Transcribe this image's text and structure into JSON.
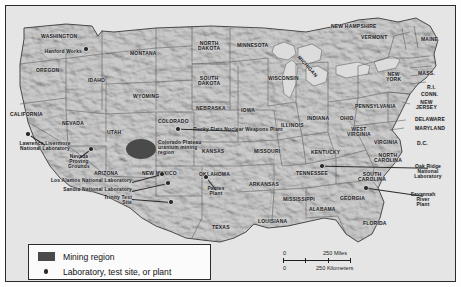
{
  "map": {
    "title": "United States nuclear weapons complex map",
    "background_color": "#c7c7c7",
    "border_color": "#2b2b2b",
    "mining_region_color": "#4a4a4a",
    "marker_color": "#2a2a2a"
  },
  "states": [
    {
      "name": "WASHINGTON",
      "x": 35,
      "y": 28,
      "size": "sm"
    },
    {
      "name": "OREGON",
      "x": 30,
      "y": 62,
      "size": "sm"
    },
    {
      "name": "IDAHO",
      "x": 82,
      "y": 72,
      "size": "sm"
    },
    {
      "name": "MONTANA",
      "x": 124,
      "y": 45,
      "size": "sm"
    },
    {
      "name": "WYOMING",
      "x": 127,
      "y": 88,
      "size": "sm"
    },
    {
      "name": "CALIFORNIA",
      "x": 4,
      "y": 106,
      "size": "sm"
    },
    {
      "name": "NEVADA",
      "x": 56,
      "y": 115,
      "size": "sm"
    },
    {
      "name": "UTAH",
      "x": 101,
      "y": 124,
      "size": "sm"
    },
    {
      "name": "ARIZONA",
      "x": 88,
      "y": 165,
      "size": "sm"
    },
    {
      "name": "COLORADO",
      "x": 152,
      "y": 113,
      "size": "sm"
    },
    {
      "name": "NEW MEXICO",
      "x": 136,
      "y": 165,
      "size": "sm"
    },
    {
      "name": "NORTH\nDAKOTA",
      "x": 192,
      "y": 35,
      "size": "sm"
    },
    {
      "name": "SOUTH\nDAKOTA",
      "x": 192,
      "y": 70,
      "size": "sm"
    },
    {
      "name": "NEBRASKA",
      "x": 190,
      "y": 100,
      "size": "sm"
    },
    {
      "name": "KANSAS",
      "x": 196,
      "y": 143,
      "size": "sm"
    },
    {
      "name": "OKLAHOMA",
      "x": 193,
      "y": 166,
      "size": "sm"
    },
    {
      "name": "TEXAS",
      "x": 206,
      "y": 219,
      "size": "sm"
    },
    {
      "name": "MINNESOTA",
      "x": 231,
      "y": 37,
      "size": "sm"
    },
    {
      "name": "IOWA",
      "x": 235,
      "y": 102,
      "size": "sm"
    },
    {
      "name": "MISSOURI",
      "x": 248,
      "y": 143,
      "size": "sm"
    },
    {
      "name": "ARKANSAS",
      "x": 243,
      "y": 176,
      "size": "sm"
    },
    {
      "name": "LOUISIANA",
      "x": 252,
      "y": 213,
      "size": "sm"
    },
    {
      "name": "WISCONSIN",
      "x": 262,
      "y": 70,
      "size": "sm"
    },
    {
      "name": "ILLINOIS",
      "x": 275,
      "y": 117,
      "size": "sm"
    },
    {
      "name": "MISSISSIPPI",
      "x": 277,
      "y": 191,
      "size": "sm"
    },
    {
      "name": "INDIANA",
      "x": 301,
      "y": 110,
      "size": "sm"
    },
    {
      "name": "KENTUCKY",
      "x": 305,
      "y": 144,
      "size": "sm"
    },
    {
      "name": "TENNESSEE",
      "x": 290,
      "y": 165,
      "size": "sm"
    },
    {
      "name": "ALABAMA",
      "x": 303,
      "y": 201,
      "size": "sm"
    },
    {
      "name": "OHIO",
      "x": 334,
      "y": 110,
      "size": "sm"
    },
    {
      "name": "WEST\nVIRGINIA",
      "x": 341,
      "y": 121,
      "size": "sm"
    },
    {
      "name": "VIRGINIA",
      "x": 368,
      "y": 134,
      "size": "sm"
    },
    {
      "name": "NORTH\nCAROLINA",
      "x": 368,
      "y": 147,
      "size": "sm"
    },
    {
      "name": "SOUTH\nCAROLINA",
      "x": 352,
      "y": 166,
      "size": "sm"
    },
    {
      "name": "GEORGIA",
      "x": 334,
      "y": 190,
      "size": "sm"
    },
    {
      "name": "FLORIDA",
      "x": 357,
      "y": 215,
      "size": "sm"
    },
    {
      "name": "PENNSYLVANIA",
      "x": 349,
      "y": 98,
      "size": "sm"
    },
    {
      "name": "NEW\nYORK",
      "x": 380,
      "y": 66,
      "size": "sm"
    },
    {
      "name": "NEW HAMPSHIRE",
      "x": 325,
      "y": 18,
      "size": "sm"
    },
    {
      "name": "VERMONT",
      "x": 355,
      "y": 29,
      "size": "sm"
    },
    {
      "name": "MAINE",
      "x": 415,
      "y": 31,
      "size": "sm"
    },
    {
      "name": "MASS.",
      "x": 412,
      "y": 65,
      "size": "sm"
    },
    {
      "name": "R.I.",
      "x": 421,
      "y": 79,
      "size": "sm"
    },
    {
      "name": "CONN.",
      "x": 415,
      "y": 86,
      "size": "sm"
    },
    {
      "name": "NEW\nJERSEY",
      "x": 410,
      "y": 94,
      "size": "sm"
    },
    {
      "name": "DELAWARE",
      "x": 409,
      "y": 111,
      "size": "sm"
    },
    {
      "name": "MARYLAND",
      "x": 409,
      "y": 120,
      "size": "sm"
    },
    {
      "name": "D.C.",
      "x": 411,
      "y": 135,
      "size": "sm"
    },
    {
      "name": "MICHIGAN",
      "x": 288,
      "y": 58,
      "size": "sm"
    }
  ],
  "facilities": [
    {
      "label": "Hanford Works",
      "lx": 28,
      "ly": 43,
      "align": "rt",
      "lw": 48,
      "dx": 80,
      "dy": 43
    },
    {
      "label": "Lawrence Livermore\nNational Laboratory",
      "lx": 8,
      "ly": 135,
      "align": "ctr",
      "lw": 62,
      "dx": 22,
      "dy": 128
    },
    {
      "label": "Nevada\nProving\nGrounds",
      "lx": 56,
      "ly": 148,
      "align": "ctr",
      "lw": 34,
      "dx": 85,
      "dy": 143
    },
    {
      "label": "Los Alamos National Laboratory",
      "lx": 8,
      "ly": 172,
      "align": "rt",
      "lw": 118,
      "dx": 156,
      "dy": 168
    },
    {
      "label": "Sandia National Laboratory",
      "lx": 20,
      "ly": 181,
      "align": "rt",
      "lw": 106,
      "dx": 162,
      "dy": 177
    },
    {
      "label": "Trinity Test\nSite",
      "lx": 76,
      "ly": 189,
      "align": "rt",
      "lw": 50,
      "dx": 165,
      "dy": 196
    },
    {
      "label": "Pantex\nPlant",
      "lx": 196,
      "ly": 180,
      "align": "ctr",
      "lw": 28,
      "dx": 200,
      "dy": 171
    },
    {
      "label": "Rocky Flats Nuclear Weapons Plant",
      "lx": 177,
      "ly": 121,
      "align": "ctr",
      "lw": 110,
      "dx": 172,
      "dy": 123
    },
    {
      "label": "Oak Ridge\nNational\nLaboratory",
      "lx": 398,
      "ly": 158,
      "align": "ctr",
      "lw": 48,
      "dx": 316,
      "dy": 160
    },
    {
      "label": "Savannah\nRiver\nPlant",
      "lx": 398,
      "ly": 186,
      "align": "ctr",
      "lw": 38,
      "dx": 360,
      "dy": 182
    }
  ],
  "mining_region": {
    "label": "Colorado Plateau\nuranium mining\nregion",
    "x": 152,
    "y": 134
  },
  "legend": {
    "items": [
      {
        "icon": "mining-swatch",
        "label": "Mining region"
      },
      {
        "icon": "facility-dot",
        "label": "Laboratory, test site, or plant"
      }
    ]
  },
  "scale_bar": {
    "miles_zero": "0",
    "miles_label": "250 Miles",
    "km_zero": "0",
    "km_label": "250 Kilometers"
  }
}
